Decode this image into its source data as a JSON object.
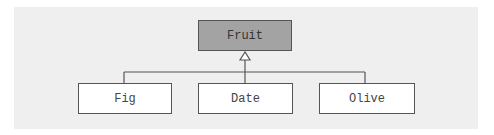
{
  "diagram": {
    "type": "uml-class-inheritance",
    "parent": {
      "label": "Fruit",
      "fill": "#a3a3a3"
    },
    "children": [
      {
        "label": "Fig"
      },
      {
        "label": "Date"
      },
      {
        "label": "Olive"
      }
    ],
    "relationship": "generalization",
    "colors": {
      "panel": "#efefef",
      "line": "#555555",
      "child_fill": "#ffffff"
    }
  }
}
